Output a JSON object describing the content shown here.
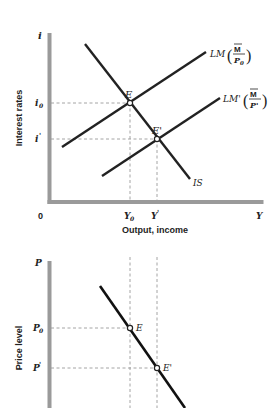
{
  "colors": {
    "axis": "#9a9a9a",
    "curve": "#222222",
    "dashed": "#999999",
    "text": "#222222",
    "background": "#ffffff"
  },
  "top_panel": {
    "y_axis_symbol": "i",
    "y_axis_title": "Interest rates",
    "x_axis_title": "Output, income",
    "origin_label": "0",
    "y_ticks": [
      {
        "label": "i",
        "sub": "0",
        "y": 103
      },
      {
        "label": "i",
        "sub": "'",
        "y": 139
      }
    ],
    "x_ticks": [
      {
        "label": "Y",
        "sub": "0",
        "x": 130
      },
      {
        "label": "Y",
        "sub": "'",
        "x": 157
      },
      {
        "label": "Y",
        "sub": "",
        "x": 260
      }
    ],
    "curves": {
      "lm": {
        "name": "LM",
        "frac_num": "M",
        "frac_den": "P",
        "frac_den_sub": "0"
      },
      "lm_prime": {
        "name": "LM'",
        "frac_num": "M",
        "frac_den": "P'",
        "frac_den_sub": ""
      },
      "is": {
        "name": "IS"
      }
    },
    "points": [
      {
        "label": "E",
        "x": 130,
        "y": 103
      },
      {
        "label": "E'",
        "x": 157,
        "y": 139
      }
    ]
  },
  "bottom_panel": {
    "y_axis_symbol": "P",
    "y_axis_title": "Price level",
    "y_ticks": [
      {
        "label": "P",
        "sub": "0",
        "y": 328
      },
      {
        "label": "P",
        "sub": "'",
        "y": 368
      }
    ],
    "points": [
      {
        "label": "E",
        "x": 130,
        "y": 328
      },
      {
        "label": "E'",
        "x": 157,
        "y": 368
      }
    ]
  }
}
